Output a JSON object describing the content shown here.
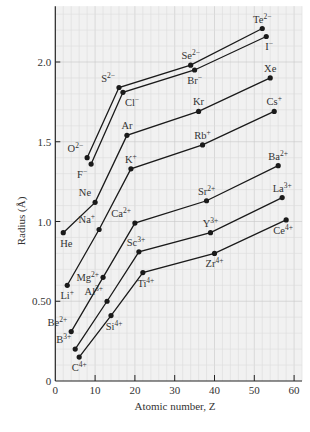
{
  "chart_data": {
    "type": "line",
    "title": "",
    "xlabel": "Atomic number, Z",
    "ylabel": "Radius (Å)",
    "xlim": [
      0,
      62
    ],
    "ylim": [
      0,
      2.35
    ],
    "x_ticks": [
      0,
      10,
      20,
      30,
      40,
      50,
      60
    ],
    "x_tick_labels": [
      "0",
      "10",
      "20",
      "30",
      "40",
      "50",
      "60"
    ],
    "y_ticks": [
      0,
      0.5,
      1.0,
      1.5,
      2.0
    ],
    "y_tick_labels": [
      "0",
      "0.50",
      "1.0",
      "1.5",
      "2.0"
    ],
    "grid": true,
    "legend": "none (points labeled directly)",
    "series": [
      {
        "name": "2- anions",
        "points": [
          {
            "label": "O2-",
            "base": "O",
            "sup": "2−",
            "x": 8,
            "y": 1.4,
            "lx": -4,
            "ly": -1
          },
          {
            "label": "S2-",
            "base": "S",
            "sup": "2−",
            "x": 16,
            "y": 1.84,
            "lx": -4,
            "ly": -1
          },
          {
            "label": "Se2-",
            "base": "Se",
            "sup": "2−",
            "x": 34,
            "y": 1.98,
            "lx": 0,
            "ly": -1
          },
          {
            "label": "Te2-",
            "base": "Te",
            "sup": "2−",
            "x": 52,
            "y": 2.21,
            "lx": 0,
            "ly": -1
          }
        ]
      },
      {
        "name": "1- anions",
        "points": [
          {
            "label": "F-",
            "base": "F",
            "sup": "−",
            "x": 9,
            "y": 1.36,
            "lx": -2,
            "ly": 1
          },
          {
            "label": "Cl-",
            "base": "Cl",
            "sup": "−",
            "x": 17,
            "y": 1.81,
            "lx": 3,
            "ly": 1
          },
          {
            "label": "Br-",
            "base": "Br",
            "sup": "−",
            "x": 35,
            "y": 1.95,
            "lx": 0,
            "ly": 1
          },
          {
            "label": "I-",
            "base": "I",
            "sup": "−",
            "x": 53,
            "y": 2.16,
            "lx": 1,
            "ly": 1
          }
        ]
      },
      {
        "name": "noble gases",
        "points": [
          {
            "label": "He",
            "base": "He",
            "sup": "",
            "x": 2,
            "y": 0.93,
            "lx": 1,
            "ly": 1
          },
          {
            "label": "Ne",
            "base": "Ne",
            "sup": "",
            "x": 10,
            "y": 1.12,
            "lx": -3,
            "ly": -1
          },
          {
            "label": "Ar",
            "base": "Ar",
            "sup": "",
            "x": 18,
            "y": 1.54,
            "lx": 0,
            "ly": -1
          },
          {
            "label": "Kr",
            "base": "Kr",
            "sup": "",
            "x": 36,
            "y": 1.69,
            "lx": 0,
            "ly": -1
          },
          {
            "label": "Xe",
            "base": "Xe",
            "sup": "",
            "x": 54,
            "y": 1.9,
            "lx": 0,
            "ly": -1
          }
        ]
      },
      {
        "name": "1+ cations",
        "points": [
          {
            "label": "Li+",
            "base": "Li",
            "sup": "+",
            "x": 3,
            "y": 0.6,
            "lx": 0,
            "ly": 1
          },
          {
            "label": "Na+",
            "base": "Na",
            "sup": "+",
            "x": 11,
            "y": 0.95,
            "lx": -4,
            "ly": -1
          },
          {
            "label": "K+",
            "base": "K",
            "sup": "+",
            "x": 19,
            "y": 1.33,
            "lx": 0,
            "ly": -1
          },
          {
            "label": "Rb+",
            "base": "Rb",
            "sup": "+",
            "x": 37,
            "y": 1.48,
            "lx": 0,
            "ly": -1
          },
          {
            "label": "Cs+",
            "base": "Cs",
            "sup": "+",
            "x": 55,
            "y": 1.69,
            "lx": 0,
            "ly": -1
          }
        ]
      },
      {
        "name": "2+ cations",
        "points": [
          {
            "label": "Be2+",
            "base": "Be",
            "sup": "2+",
            "x": 4,
            "y": 0.31,
            "lx": -3,
            "ly": -1
          },
          {
            "label": "Mg2+",
            "base": "Mg",
            "sup": "2+",
            "x": 12,
            "y": 0.65,
            "lx": -4,
            "ly": 0
          },
          {
            "label": "Ca2+",
            "base": "Ca",
            "sup": "2+",
            "x": 20,
            "y": 0.99,
            "lx": -2,
            "ly": -1
          },
          {
            "label": "Sr2+",
            "base": "Sr",
            "sup": "2+",
            "x": 38,
            "y": 1.13,
            "lx": 0,
            "ly": -1
          },
          {
            "label": "Ba2+",
            "base": "Ba",
            "sup": "2+",
            "x": 56,
            "y": 1.35,
            "lx": 0,
            "ly": -1
          }
        ]
      },
      {
        "name": "3+ cations",
        "points": [
          {
            "label": "B3+",
            "base": "B",
            "sup": "3+",
            "x": 5,
            "y": 0.2,
            "lx": -3,
            "ly": -1
          },
          {
            "label": "Al3+",
            "base": "Al",
            "sup": "3+",
            "x": 13,
            "y": 0.5,
            "lx": -3,
            "ly": -1
          },
          {
            "label": "Sc3+",
            "base": "Sc",
            "sup": "3+",
            "x": 21,
            "y": 0.81,
            "lx": -1,
            "ly": -1
          },
          {
            "label": "Y3+",
            "base": "Y",
            "sup": "3+",
            "x": 39,
            "y": 0.93,
            "lx": 0,
            "ly": -1
          },
          {
            "label": "La3+",
            "base": "La",
            "sup": "3+",
            "x": 57,
            "y": 1.15,
            "lx": 0,
            "ly": -1
          }
        ]
      },
      {
        "name": "4+ cations",
        "points": [
          {
            "label": "C4+",
            "base": "C",
            "sup": "4+",
            "x": 6,
            "y": 0.15,
            "lx": 0,
            "ly": 1
          },
          {
            "label": "Si4+",
            "base": "Si",
            "sup": "4+",
            "x": 14,
            "y": 0.41,
            "lx": 1,
            "ly": 1
          },
          {
            "label": "Ti4+",
            "base": "Ti",
            "sup": "4+",
            "x": 22,
            "y": 0.68,
            "lx": 1,
            "ly": 1
          },
          {
            "label": "Zr4+",
            "base": "Zr",
            "sup": "4+",
            "x": 40,
            "y": 0.8,
            "lx": 0,
            "ly": 1
          },
          {
            "label": "Ce4+",
            "base": "Ce",
            "sup": "4+",
            "x": 58,
            "y": 1.01,
            "lx": -1,
            "ly": 1
          }
        ]
      }
    ]
  },
  "colors": {
    "background": "#ffffff",
    "plot_background": "#f1f1f1",
    "grid_minor": "#dcdcdc",
    "grid_major": "#c8c8c8",
    "line": "#1a1a1a",
    "text": "#333333"
  }
}
